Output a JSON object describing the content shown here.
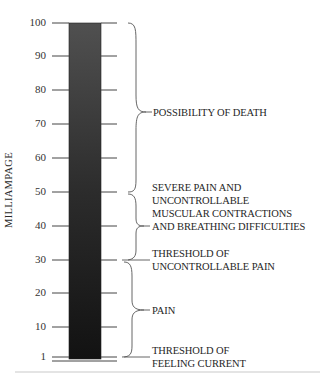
{
  "diagram": {
    "axis_label": "MILLIAMPAGE",
    "ticks": [
      {
        "label": "100",
        "y": 23
      },
      {
        "label": "90",
        "y": 56
      },
      {
        "label": "80",
        "y": 90
      },
      {
        "label": "70",
        "y": 124
      },
      {
        "label": "60",
        "y": 158
      },
      {
        "label": "50",
        "y": 192
      },
      {
        "label": "40",
        "y": 226
      },
      {
        "label": "30",
        "y": 260
      },
      {
        "label": "20",
        "y": 293
      },
      {
        "label": "10",
        "y": 327
      },
      {
        "label": "1",
        "y": 357
      }
    ],
    "bar": {
      "color_top": "#4a4a4a",
      "color_bottom": "#141414"
    },
    "regions": [
      {
        "label_line1": "POSSIBILITY OF DEATH"
      },
      {
        "label_line1": "SEVERE PAIN AND",
        "label_line2": "UNCONTROLLABLE",
        "label_line3": "MUSCULAR CONTRACTIONS",
        "label_line4": "AND BREATHING DIFFICULTIES"
      },
      {
        "label_line1": "THRESHOLD OF",
        "label_line2": "UNCONTROLLABLE PAIN"
      },
      {
        "label_line1": "PAIN"
      },
      {
        "label_line1": "THRESHOLD OF",
        "label_line2": "FEELING CURRENT"
      }
    ]
  }
}
